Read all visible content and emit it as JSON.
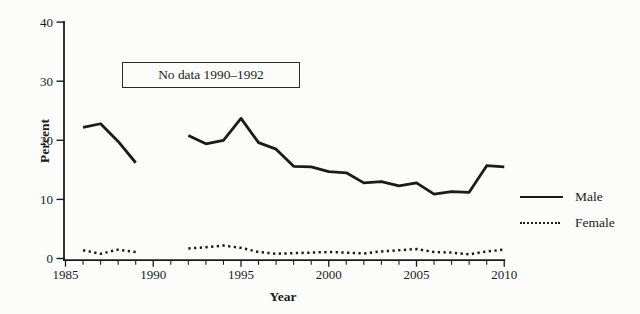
{
  "figure": {
    "background": "#fcfcfa",
    "ink_color": "#1b1b1b"
  },
  "chart_data": {
    "type": "line",
    "title": "",
    "xlabel": "Year",
    "ylabel": "Percent",
    "xlim": [
      1985,
      2010
    ],
    "ylim": [
      0,
      40
    ],
    "y_ticks": [
      0,
      10,
      20,
      30,
      40
    ],
    "x_major_ticks": [
      1985,
      1990,
      1995,
      2000,
      2005,
      2010
    ],
    "x_minor_tick_step": 1,
    "grid": false,
    "legend_position": "right-middle",
    "annotation": "No data 1990–1992",
    "series": [
      {
        "name": "Male",
        "line_style": "solid",
        "color": "#1b1b1b",
        "segments": [
          {
            "years": [
              1986,
              1987,
              1988,
              1989
            ],
            "values": [
              22.2,
              22.8,
              19.8,
              16.2
            ]
          },
          {
            "years": [
              1992,
              1993,
              1994,
              1995,
              1996,
              1997,
              1998,
              1999,
              2000,
              2001,
              2002,
              2003,
              2004,
              2005,
              2006,
              2007,
              2008,
              2009,
              2010
            ],
            "values": [
              20.8,
              19.4,
              20.0,
              23.7,
              19.6,
              18.5,
              15.6,
              15.5,
              14.7,
              14.5,
              12.8,
              13.0,
              12.3,
              12.8,
              10.9,
              11.3,
              11.2,
              15.7,
              15.5
            ]
          }
        ]
      },
      {
        "name": "Female",
        "line_style": "dotted",
        "color": "#1b1b1b",
        "segments": [
          {
            "years": [
              1986,
              1987,
              1988,
              1989
            ],
            "values": [
              1.4,
              0.8,
              1.5,
              1.1
            ]
          },
          {
            "years": [
              1992,
              1993,
              1994,
              1995,
              1996,
              1997,
              1998,
              1999,
              2000,
              2001,
              2002,
              2003,
              2004,
              2005,
              2006,
              2007,
              2008,
              2009,
              2010
            ],
            "values": [
              1.7,
              1.9,
              2.2,
              1.8,
              1.1,
              0.8,
              0.9,
              1.0,
              1.1,
              1.0,
              0.85,
              1.2,
              1.4,
              1.6,
              1.1,
              1.0,
              0.7,
              1.2,
              1.5
            ]
          }
        ]
      }
    ]
  }
}
